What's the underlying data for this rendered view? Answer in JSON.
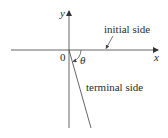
{
  "diagram": {
    "axes": {
      "x_label": "x",
      "y_label": "y",
      "origin_label": "0"
    },
    "angle_label": "θ",
    "annotations": {
      "initial_side": "initial side",
      "terminal_side": "terminal side"
    },
    "colors": {
      "line": "#555555",
      "text": "#2a2a2a",
      "background": "#ffffff"
    }
  }
}
